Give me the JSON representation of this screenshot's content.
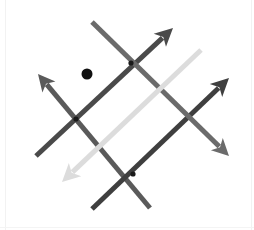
{
  "canvas": {
    "width": 254,
    "height": 230,
    "background": "#ffffff",
    "title": "Abstract arrow diagram"
  },
  "chart_data": {
    "type": "diagram",
    "xlabel": "",
    "ylabel": "",
    "grid": false,
    "legend": "none"
  },
  "arrows": [
    {
      "id": "arrow-up-left-dark",
      "name": "arrow-up-left",
      "color": "#5a5a5a",
      "width": 5,
      "tail_x": 150,
      "tail_y": 208,
      "tip_x": 38,
      "tip_y": 74,
      "head_size": 17,
      "direction": "up-left"
    },
    {
      "id": "arrow-up-right-dark-left",
      "name": "arrow-up-right-inner",
      "color": "#4a4a4a",
      "width": 5,
      "tail_x": 36,
      "tail_y": 156,
      "tip_x": 173,
      "tip_y": 28,
      "head_size": 18,
      "direction": "up-right"
    },
    {
      "id": "arrow-up-right-dark-right",
      "name": "arrow-up-right-outer",
      "color": "#3f3f3f",
      "width": 5,
      "tail_x": 92,
      "tail_y": 209,
      "tip_x": 229,
      "tip_y": 78,
      "head_size": 18,
      "direction": "up-right"
    },
    {
      "id": "arrow-down-right-gray",
      "name": "arrow-down-right",
      "color": "#6b6b6b",
      "width": 5,
      "tail_x": 92,
      "tail_y": 22,
      "tip_x": 229,
      "tip_y": 156,
      "head_size": 17,
      "direction": "down-right"
    },
    {
      "id": "arrow-down-left-light",
      "name": "arrow-down-left",
      "color": "#dcdcdc",
      "width": 5,
      "tail_x": 201,
      "tail_y": 50,
      "tip_x": 62,
      "tip_y": 182,
      "head_size": 18,
      "direction": "down-left"
    }
  ],
  "points": [
    {
      "id": "point-marker",
      "name": "isolated-point",
      "x": 87,
      "y": 74,
      "radius": 5.5,
      "color": "#111111"
    },
    {
      "id": "node-top",
      "name": "intersection-node-top",
      "x": 131,
      "y": 63,
      "radius": 2.6,
      "color": "#1a1a1a"
    },
    {
      "id": "node-left",
      "name": "intersection-node-left",
      "x": 76,
      "y": 119,
      "radius": 2.6,
      "color": "#1a1a1a"
    },
    {
      "id": "node-bottom",
      "name": "intersection-node-bottom",
      "x": 133,
      "y": 174,
      "radius": 2.6,
      "color": "#1a1a1a"
    }
  ],
  "colors": {
    "background": "#ffffff",
    "dark": "#4a4a4a",
    "mid_gray": "#6b6b6b",
    "light_gray": "#dcdcdc",
    "dot": "#111111",
    "edge": "#f2f2f2"
  }
}
